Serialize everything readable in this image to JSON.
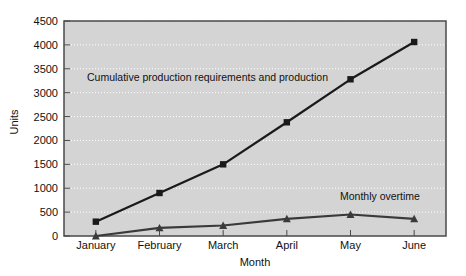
{
  "chart_data": {
    "type": "line",
    "title": "",
    "xlabel": "Month",
    "ylabel": "Units",
    "categories": [
      "January",
      "February",
      "March",
      "April",
      "May",
      "June"
    ],
    "ylim": [
      0,
      4500
    ],
    "yticks": [
      0,
      500,
      1000,
      1500,
      2000,
      2500,
      3000,
      3500,
      4000,
      4500
    ],
    "ytick_labels": [
      "0",
      "500",
      "1000",
      "1500",
      "2000",
      "2500",
      "3000",
      "3500",
      "4000",
      "4500"
    ],
    "grid": true,
    "legend_position": "inline-annotations",
    "series": [
      {
        "name": "Cumulative production requirements and production",
        "marker": "square",
        "color": "#1a1a1a",
        "values": [
          300,
          900,
          1500,
          2380,
          3280,
          4060
        ]
      },
      {
        "name": "Monthly overtime",
        "marker": "triangle",
        "color": "#3a3a3a",
        "values": [
          0,
          170,
          220,
          360,
          450,
          360
        ]
      }
    ],
    "annotations": [
      {
        "id": "cumulative",
        "text": "Cumulative production requirements and production"
      },
      {
        "id": "overtime",
        "text": "Monthly overtime"
      }
    ]
  },
  "axes": {
    "y_label": "Units",
    "x_label": "Month",
    "y_ticks": [
      "0",
      "500",
      "1000",
      "1500",
      "2000",
      "2500",
      "3000",
      "3500",
      "4000",
      "4500"
    ],
    "x_ticks": [
      "January",
      "February",
      "March",
      "April",
      "May",
      "June"
    ]
  },
  "colors": {
    "plot_background": "#d4d4d4",
    "page_background": "#ffffff",
    "gridline": "#ffffff",
    "axis_border": "#4a4a4a",
    "series_cumulative": "#1a1a1a",
    "series_overtime": "#3a3a3a",
    "text": "#111111"
  }
}
